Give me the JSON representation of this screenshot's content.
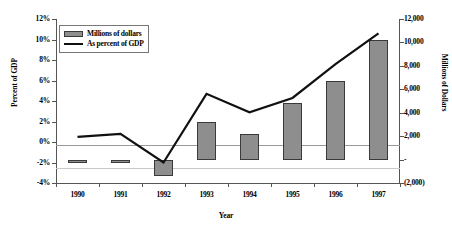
{
  "chart_data": {
    "type": "bar",
    "title": "",
    "xlabel": "Year",
    "ylabel": "Percent of GDP",
    "y2label": "Millions of Dollars",
    "categories": [
      "1990",
      "1991",
      "1992",
      "1993",
      "1994",
      "1995",
      "1996",
      "1997"
    ],
    "grid": false,
    "legend_position": "top-left",
    "ylim": [
      -4,
      12
    ],
    "y2lim": [
      -2000,
      12000
    ],
    "yticks": [
      "-4%",
      "-2%",
      "0%",
      "2%",
      "4%",
      "6%",
      "8%",
      "10%",
      "12%"
    ],
    "ytick_values": [
      -4,
      -2,
      0,
      2,
      4,
      6,
      8,
      10,
      12
    ],
    "y2ticks": [
      "(2,000)",
      "-",
      "2,000",
      "4,000",
      "6,000",
      "8,000",
      "10,000",
      "12,000"
    ],
    "y2tick_values": [
      -2000,
      0,
      2000,
      4000,
      6000,
      8000,
      10000,
      12000
    ],
    "series": [
      {
        "name": "Millions of dollars",
        "type": "bar",
        "axis": "right",
        "color": "#8e8e8e",
        "values": [
          -300,
          -200,
          -1400,
          3200,
          2200,
          4800,
          6700,
          10200
        ]
      },
      {
        "name": "As percent of GDP",
        "type": "line",
        "axis": "left",
        "color": "#111111",
        "values": [
          0.5,
          0.8,
          -2.0,
          4.7,
          2.9,
          4.3,
          7.6,
          10.6
        ]
      }
    ]
  },
  "legend": {
    "items": [
      {
        "label": "Millions of dollars"
      },
      {
        "label": "As percent of GDP"
      }
    ]
  },
  "axes": {
    "left_title": "Percent of GDP",
    "right_title": "Millions of Dollars",
    "x_title": "Year"
  }
}
